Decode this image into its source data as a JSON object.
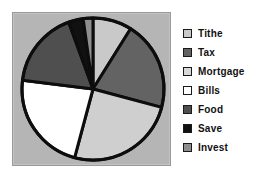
{
  "chart_data": {
    "type": "pie",
    "title": "",
    "subtitle": "",
    "xlabel": "",
    "ylabel": "",
    "categories": [
      "Tithe",
      "Tax",
      "Mortgage",
      "Bills",
      "Food",
      "Save",
      "Invest"
    ],
    "values": [
      9,
      20,
      25,
      23,
      17,
      3,
      3
    ],
    "unit": "percent",
    "start_angle_deg": 0,
    "direction": "clockwise",
    "slices": [
      {
        "label": "Tithe",
        "value": 9,
        "start_deg": 0,
        "end_deg": 32,
        "color": "#c9c9c9"
      },
      {
        "label": "Tax",
        "value": 20,
        "start_deg": 32,
        "end_deg": 105,
        "color": "#636363"
      },
      {
        "label": "Mortgage",
        "value": 25,
        "start_deg": 105,
        "end_deg": 195,
        "color": "#cfcfcf"
      },
      {
        "label": "Bills",
        "value": 23,
        "start_deg": 195,
        "end_deg": 277,
        "color": "#ffffff"
      },
      {
        "label": "Food",
        "value": 17,
        "start_deg": 277,
        "end_deg": 340,
        "color": "#4f4f4f"
      },
      {
        "label": "Save",
        "value": 3,
        "start_deg": 340,
        "end_deg": 352,
        "color": "#111111"
      },
      {
        "label": "Invest",
        "value": 3,
        "start_deg": 352,
        "end_deg": 360,
        "color": "#8f8f8f"
      }
    ],
    "legend": {
      "position": "right",
      "entries": [
        {
          "label": "Tithe",
          "color": "#c9c9c9"
        },
        {
          "label": "Tax",
          "color": "#636363"
        },
        {
          "label": "Mortgage",
          "color": "#d8d8d8"
        },
        {
          "label": "Bills",
          "color": "#ffffff"
        },
        {
          "label": "Food",
          "color": "#4f4f4f"
        },
        {
          "label": "Save",
          "color": "#111111"
        },
        {
          "label": "Invest",
          "color": "#8f8f8f"
        }
      ]
    },
    "style": {
      "plot_background": "#b5b5b5",
      "slice_outline": "#0d0d0d",
      "slice_outline_width": 3,
      "grid": false,
      "page_background": "#ffffff"
    }
  }
}
